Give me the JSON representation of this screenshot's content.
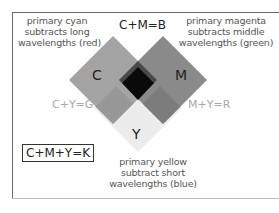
{
  "diagram": {
    "type": "subtractive-color-mixing",
    "primaries": {
      "cyan": {
        "label": "C",
        "description": [
          "primary cyan",
          "subtracts long",
          "wavelengths (red)"
        ]
      },
      "magenta": {
        "label": "M",
        "description": [
          "primary magenta",
          "subtracts middle",
          "wavelengths (green)"
        ]
      },
      "yellow": {
        "label": "Y",
        "description": [
          "primary yellow",
          "subtract short",
          "wavelengths (blue)"
        ]
      }
    },
    "mixtures": {
      "cm": "C+M=B",
      "cy": "C+Y=G",
      "my": "M+Y=R",
      "cmy": "C+M+Y=K"
    },
    "colors": {
      "cyan_region": "#a4a4a4",
      "magenta_region": "#8a8a8a",
      "yellow_region": "#ececec",
      "cm_overlap": "#4a4a4a",
      "cy_overlap": "#989898",
      "my_overlap": "#7c7c7c",
      "cmy_overlap": "#0a0a0a"
    }
  }
}
